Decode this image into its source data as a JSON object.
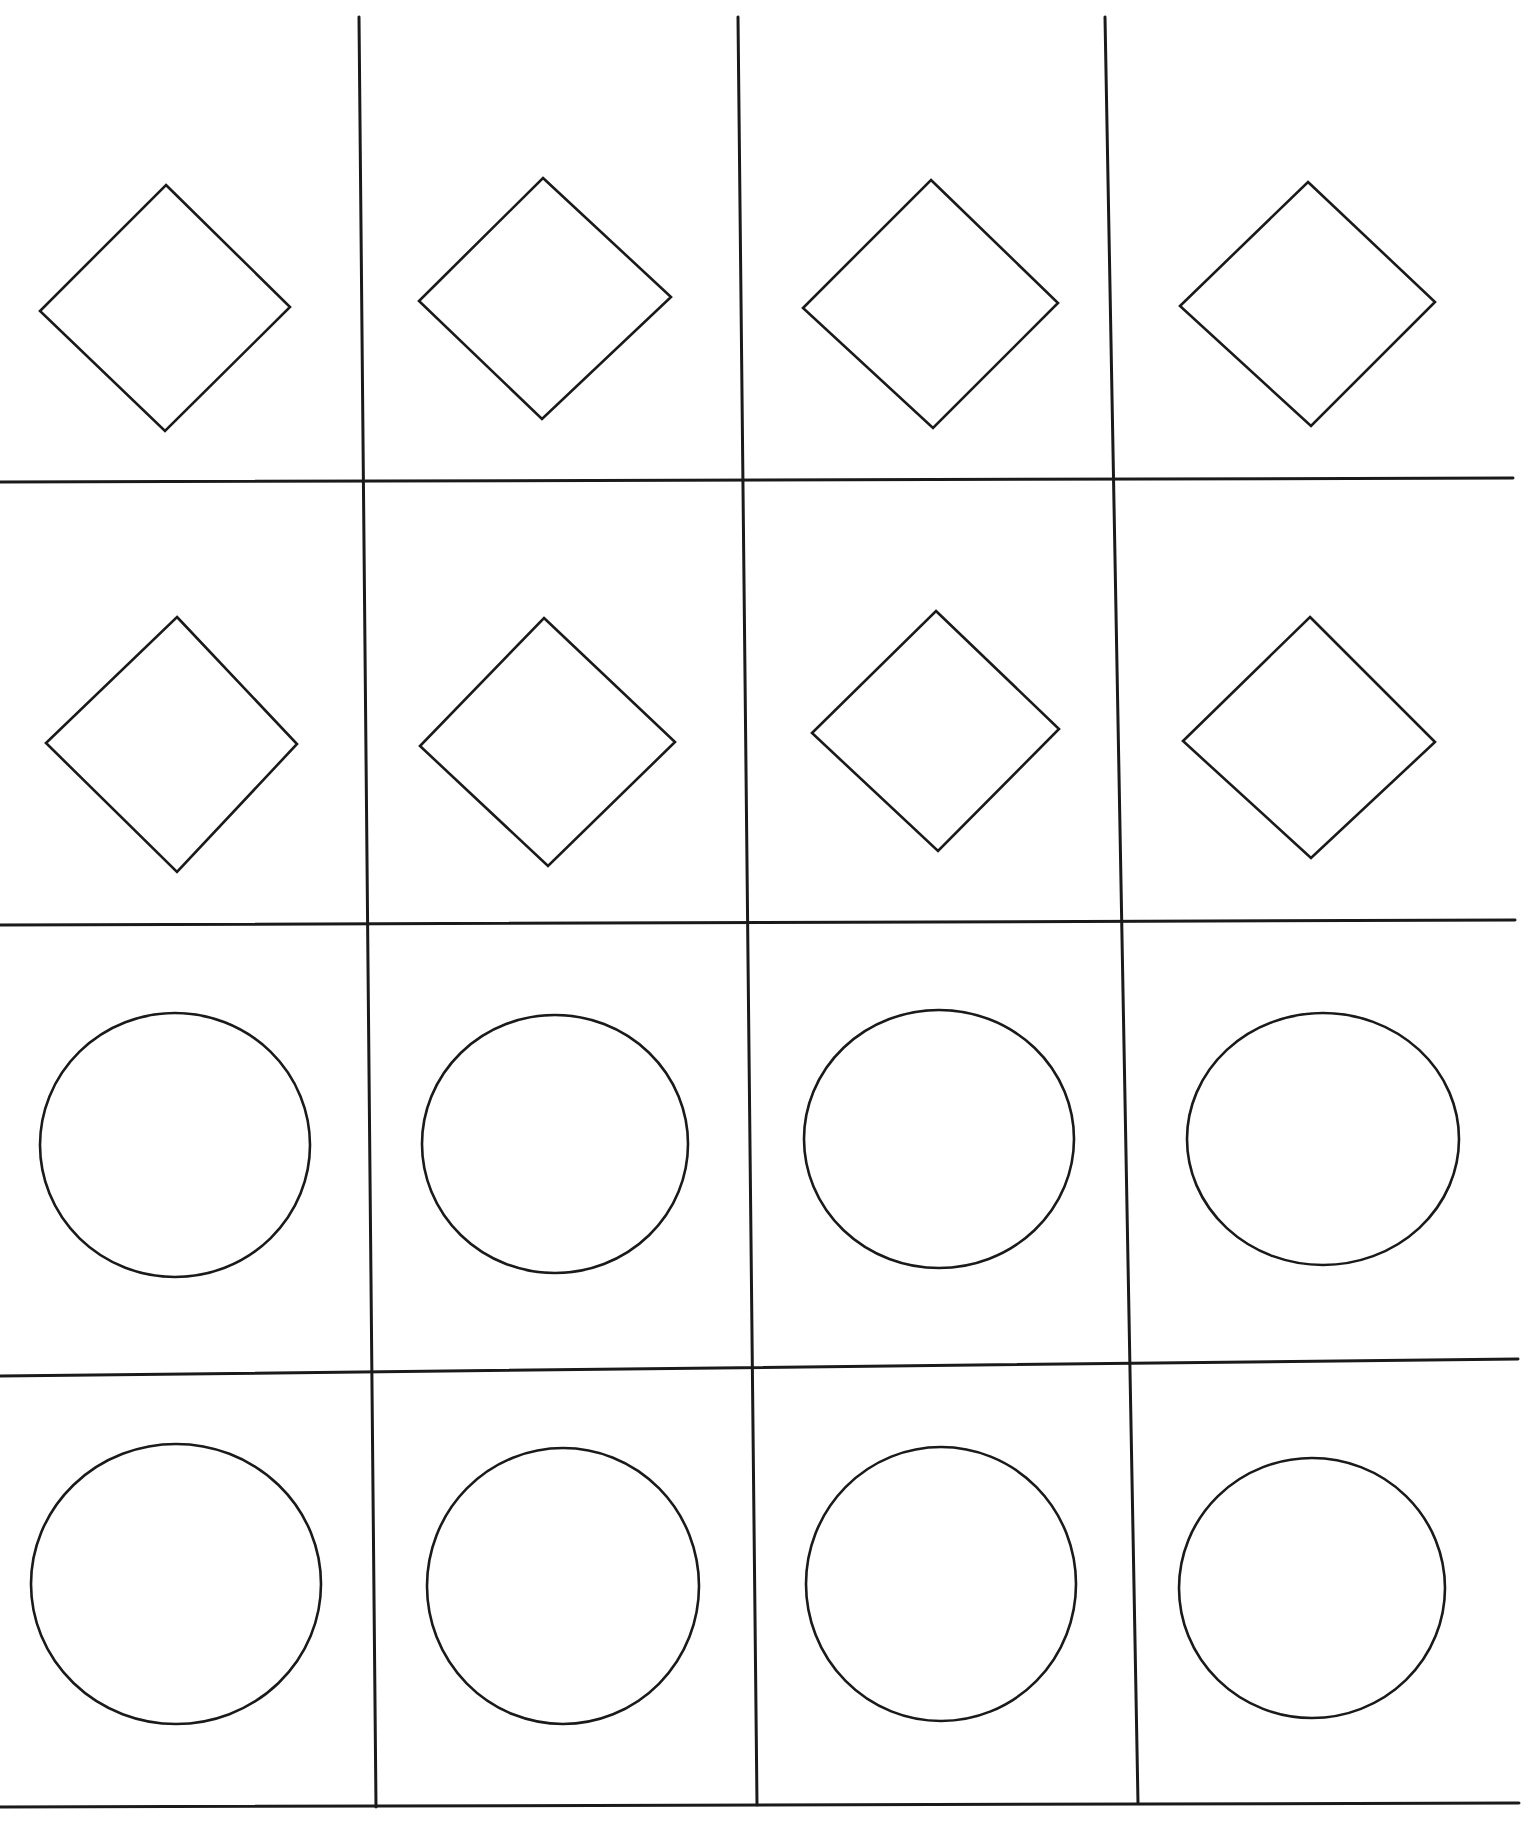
{
  "figure": {
    "rows": 4,
    "columns": 4,
    "stroke_color": "#1a1a1a",
    "background_color": "#ffffff"
  },
  "grid": {
    "horizontal_lines": [
      {
        "x1": 0,
        "y1": 482,
        "x2": 1513,
        "y2": 478
      },
      {
        "x1": 0,
        "y1": 925,
        "x2": 1515,
        "y2": 920
      },
      {
        "x1": 0,
        "y1": 1376,
        "x2": 1518,
        "y2": 1359
      },
      {
        "x1": 0,
        "y1": 1807,
        "x2": 1519,
        "y2": 1803
      }
    ],
    "vertical_lines": [
      {
        "x1": 359,
        "y1": 17,
        "x2": 376,
        "y2": 1807
      },
      {
        "x1": 738,
        "y1": 17,
        "x2": 757,
        "y2": 1805
      },
      {
        "x1": 1105,
        "y1": 17,
        "x2": 1138,
        "y2": 1803
      }
    ]
  },
  "cells": [
    {
      "row": 1,
      "col": 1,
      "shape": "diamond",
      "points": [
        [
          166,
          185
        ],
        [
          40,
          311
        ],
        [
          290,
          307
        ],
        [
          165,
          431
        ]
      ]
    },
    {
      "row": 1,
      "col": 2,
      "shape": "diamond",
      "points": [
        [
          543,
          178
        ],
        [
          419,
          301
        ],
        [
          671,
          297
        ],
        [
          542,
          419
        ]
      ]
    },
    {
      "row": 1,
      "col": 3,
      "shape": "diamond",
      "points": [
        [
          931,
          180
        ],
        [
          803,
          308
        ],
        [
          1058,
          303
        ],
        [
          933,
          428
        ]
      ]
    },
    {
      "row": 1,
      "col": 4,
      "shape": "diamond",
      "points": [
        [
          1308,
          182
        ],
        [
          1180,
          306
        ],
        [
          1435,
          302
        ],
        [
          1311,
          426
        ]
      ]
    },
    {
      "row": 2,
      "col": 1,
      "shape": "diamond",
      "points": [
        [
          177,
          617
        ],
        [
          46,
          743
        ],
        [
          297,
          744
        ],
        [
          177,
          872
        ]
      ]
    },
    {
      "row": 2,
      "col": 2,
      "shape": "diamond",
      "points": [
        [
          544,
          618
        ],
        [
          420,
          746
        ],
        [
          675,
          742
        ],
        [
          548,
          866
        ]
      ]
    },
    {
      "row": 2,
      "col": 3,
      "shape": "diamond",
      "points": [
        [
          936,
          611
        ],
        [
          812,
          733
        ],
        [
          1059,
          729
        ],
        [
          938,
          851
        ]
      ]
    },
    {
      "row": 2,
      "col": 4,
      "shape": "diamond",
      "points": [
        [
          1310,
          617
        ],
        [
          1183,
          741
        ],
        [
          1435,
          742
        ],
        [
          1311,
          858
        ]
      ]
    },
    {
      "row": 3,
      "col": 1,
      "shape": "circle",
      "cx": 175,
      "cy": 1145,
      "rx": 135,
      "ry": 132
    },
    {
      "row": 3,
      "col": 2,
      "shape": "circle",
      "cx": 555,
      "cy": 1144,
      "rx": 133,
      "ry": 129
    },
    {
      "row": 3,
      "col": 3,
      "shape": "circle",
      "cx": 939,
      "cy": 1139,
      "rx": 135,
      "ry": 129
    },
    {
      "row": 3,
      "col": 4,
      "shape": "circle",
      "cx": 1323,
      "cy": 1139,
      "rx": 136,
      "ry": 126
    },
    {
      "row": 4,
      "col": 1,
      "shape": "circle",
      "cx": 176,
      "cy": 1584,
      "rx": 145,
      "ry": 140
    },
    {
      "row": 4,
      "col": 2,
      "shape": "circle",
      "cx": 563,
      "cy": 1586,
      "rx": 136,
      "ry": 138
    },
    {
      "row": 4,
      "col": 3,
      "shape": "circle",
      "cx": 941,
      "cy": 1584,
      "rx": 135,
      "ry": 137
    },
    {
      "row": 4,
      "col": 4,
      "shape": "circle",
      "cx": 1312,
      "cy": 1588,
      "rx": 133,
      "ry": 130
    }
  ]
}
